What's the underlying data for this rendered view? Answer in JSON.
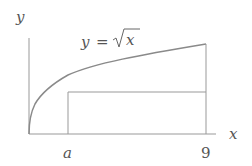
{
  "diagram": {
    "labels": {
      "y_axis": "y",
      "x_axis": "x",
      "curve": "y = ",
      "curve_radicand": "x",
      "a_tick": "a",
      "nine_tick": "9"
    },
    "colors": {
      "axis": "#888888",
      "curve": "#8a8a8a",
      "text": "#555555"
    },
    "curve": {
      "function": "sqrt(x)",
      "x_range": [
        0,
        9
      ]
    },
    "markers": {
      "a": "a",
      "right_bound": 9
    }
  }
}
